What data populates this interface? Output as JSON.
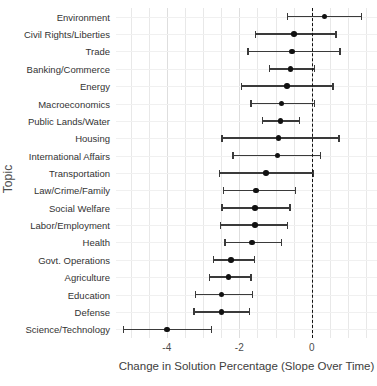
{
  "chart_data": {
    "type": "scatter",
    "title": "",
    "xlabel": "Change in Solution Percentage (Slope Over Time)",
    "ylabel": "Topic",
    "xlim": [
      -5.4,
      1.8
    ],
    "xticks": [
      -4,
      -2,
      0
    ],
    "xticklabels": [
      "-4",
      "-2",
      "0"
    ],
    "grid": true,
    "legend": "none",
    "reference_line": {
      "x": 0,
      "style": "dashed",
      "color": "#111111"
    },
    "categories": [
      "Environment",
      "Civil Rights/Liberties",
      "Trade",
      "Banking/Commerce",
      "Energy",
      "Macroeconomics",
      "Public Lands/Water",
      "Housing",
      "International Affairs",
      "Transportation",
      "Law/Crime/Family",
      "Social Welfare",
      "Labor/Employment",
      "Health",
      "Govt. Operations",
      "Agriculture",
      "Education",
      "Defense",
      "Science/Technology"
    ],
    "values": [
      0.35,
      -0.49,
      -0.54,
      -0.59,
      -0.68,
      -0.84,
      -0.86,
      -0.92,
      -0.95,
      -1.27,
      -1.54,
      -1.57,
      -1.57,
      -1.65,
      -2.22,
      -2.3,
      -2.49,
      -2.49,
      -4.0
    ],
    "ci_lower": [
      -0.68,
      -1.57,
      -1.78,
      -1.19,
      -1.95,
      -1.7,
      -1.38,
      -2.49,
      -2.19,
      -2.57,
      -2.46,
      -2.49,
      -2.54,
      -2.41,
      -2.73,
      -2.84,
      -3.22,
      -3.27,
      -5.22
    ],
    "ci_upper": [
      1.35,
      0.65,
      0.76,
      0.05,
      0.57,
      0.05,
      -0.35,
      0.73,
      0.22,
      0.03,
      -0.46,
      -0.62,
      -0.68,
      -0.86,
      -1.6,
      -1.7,
      -1.65,
      -1.73,
      -2.78
    ]
  },
  "axes": {
    "y_title": "Topic",
    "x_title": "Change in Solution Percentage (Slope Over Time)"
  }
}
